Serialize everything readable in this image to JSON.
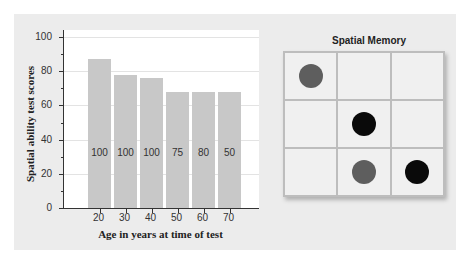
{
  "chart_data": {
    "type": "bar",
    "title": "",
    "xlabel": "Age in years at time of test",
    "ylabel": "Spatial ability test scores",
    "categories": [
      "20",
      "30",
      "40",
      "50",
      "60",
      "70"
    ],
    "values": [
      87,
      78,
      76,
      68,
      68,
      68
    ],
    "bar_labels": [
      "100",
      "100",
      "100",
      "75",
      "80",
      "50"
    ],
    "yticks": [
      0,
      20,
      40,
      60,
      80,
      100
    ],
    "ylim": [
      0,
      100
    ],
    "grid": true,
    "legend": null,
    "bar_color": "#c8c8c8"
  },
  "memory_panel": {
    "title": "Spatial Memory",
    "rows": 3,
    "cols": 3,
    "dots": [
      {
        "row": 0,
        "col": 0,
        "color": "#5e5e5e"
      },
      {
        "row": 1,
        "col": 1,
        "color": "#0a0a0a"
      },
      {
        "row": 2,
        "col": 1,
        "color": "#5e5e5e"
      },
      {
        "row": 2,
        "col": 2,
        "color": "#0a0a0a"
      }
    ]
  }
}
